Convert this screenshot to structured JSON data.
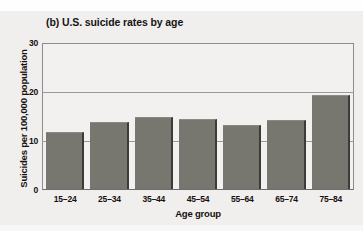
{
  "chart_data": {
    "type": "bar",
    "title": "(b) U.S. suicide rates by age",
    "xlabel": "Age group",
    "ylabel": "Suicides per 100,000 population",
    "categories": [
      "15–24",
      "25–34",
      "35–44",
      "45–54",
      "55–64",
      "65–74",
      "75–84"
    ],
    "values": [
      11.8,
      13.9,
      14.8,
      14.5,
      13.3,
      14.2,
      19.5
    ],
    "ylim": [
      0,
      30
    ],
    "yticks": [
      0,
      10,
      20,
      30
    ],
    "ytick_labels": [
      "0",
      "10",
      "20",
      "30"
    ],
    "grid": true,
    "legend": "none",
    "colors": {
      "bar_fill": "#77776f",
      "bar_shadow": "#3b3b38",
      "plot_background": "#f2f1f0",
      "figure_background": "#f0efee",
      "gridline": "#9a9a98",
      "axis": "#8d8d8c",
      "text": "#17100d"
    }
  }
}
